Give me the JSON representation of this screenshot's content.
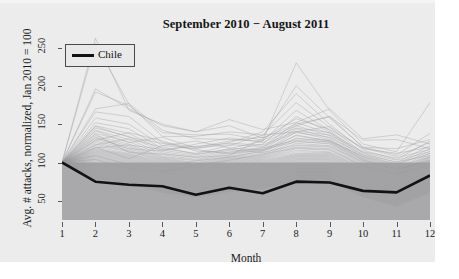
{
  "figure": {
    "title": "September 2010 − August 2011",
    "xlabel": "Month",
    "ylabel": "Avg. # attacks, normalized, Jan 2010 = 100",
    "background_color": "#ececed",
    "band_color": "#a9a9ab",
    "highlight_color": "#121212",
    "background_series_color": "#9b9b9d"
  },
  "legend": {
    "position": "top-left",
    "entries": [
      {
        "label": "Chile",
        "color": "#121212"
      }
    ]
  },
  "chart_data": {
    "type": "line",
    "title": "September 2010 − August 2011",
    "xlabel": "Month",
    "ylabel": "Avg. # attacks, normalized, Jan 2010 = 100",
    "x": [
      1,
      2,
      3,
      4,
      5,
      6,
      7,
      8,
      9,
      10,
      11,
      12
    ],
    "xtick_labels": [
      "1",
      "2",
      "3",
      "4",
      "5",
      "6",
      "7",
      "8",
      "9",
      "10",
      "11",
      "12"
    ],
    "ytick_labels": [
      "50",
      "100",
      "150",
      "200",
      "250"
    ],
    "yticks": [
      50,
      100,
      150,
      200,
      250
    ],
    "xlim": [
      1,
      12
    ],
    "ylim": [
      25,
      265
    ],
    "grid": false,
    "legend_position": "top-left",
    "shaded_band": {
      "from": 25,
      "to": 100,
      "color": "#a9a9ab"
    },
    "highlight_series": {
      "name": "Chile",
      "color": "#121212",
      "values": [
        100,
        75,
        71,
        69,
        58,
        67,
        60,
        75,
        74,
        63,
        61,
        83
      ]
    },
    "background_series": [
      {
        "name": "country-01",
        "values": [
          100,
          262,
          168,
          150,
          140,
          148,
          132,
          150,
          160,
          120,
          118,
          130
        ]
      },
      {
        "name": "country-02",
        "values": [
          100,
          255,
          176,
          134,
          134,
          140,
          136,
          140,
          147,
          118,
          112,
          120
        ]
      },
      {
        "name": "country-03",
        "values": [
          100,
          196,
          170,
          148,
          140,
          156,
          143,
          152,
          170,
          131,
          136,
          124
        ]
      },
      {
        "name": "country-04",
        "values": [
          100,
          192,
          174,
          139,
          136,
          137,
          129,
          148,
          160,
          129,
          130,
          118
        ]
      },
      {
        "name": "country-05",
        "values": [
          100,
          170,
          177,
          142,
          131,
          130,
          128,
          230,
          168,
          124,
          114,
          178
        ]
      },
      {
        "name": "country-06",
        "values": [
          100,
          166,
          160,
          126,
          120,
          128,
          133,
          200,
          158,
          120,
          110,
          138
        ]
      },
      {
        "name": "country-07",
        "values": [
          100,
          158,
          150,
          122,
          118,
          126,
          140,
          190,
          150,
          116,
          104,
          128
        ]
      },
      {
        "name": "country-08",
        "values": [
          100,
          152,
          144,
          118,
          112,
          122,
          136,
          178,
          146,
          112,
          100,
          122
        ]
      },
      {
        "name": "country-09",
        "values": [
          100,
          148,
          138,
          116,
          110,
          118,
          128,
          168,
          142,
          110,
          98,
          118
        ]
      },
      {
        "name": "country-10",
        "values": [
          100,
          145,
          134,
          114,
          108,
          116,
          124,
          160,
          140,
          108,
          96,
          115
        ]
      },
      {
        "name": "country-11",
        "values": [
          100,
          142,
          130,
          112,
          106,
          114,
          120,
          152,
          138,
          106,
          94,
          112
        ]
      },
      {
        "name": "country-12",
        "values": [
          100,
          138,
          127,
          110,
          104,
          112,
          118,
          148,
          135,
          104,
          92,
          110
        ]
      },
      {
        "name": "country-13",
        "values": [
          100,
          135,
          124,
          108,
          103,
          110,
          116,
          144,
          132,
          103,
          90,
          108
        ]
      },
      {
        "name": "country-14",
        "values": [
          100,
          132,
          122,
          107,
          102,
          108,
          114,
          140,
          130,
          102,
          89,
          107
        ]
      },
      {
        "name": "country-15",
        "values": [
          100,
          130,
          120,
          106,
          100,
          107,
          112,
          136,
          128,
          100,
          88,
          106
        ]
      },
      {
        "name": "country-16",
        "values": [
          100,
          128,
          118,
          105,
          99,
          106,
          110,
          132,
          126,
          99,
          87,
          105
        ]
      },
      {
        "name": "country-17",
        "values": [
          100,
          126,
          116,
          104,
          98,
          105,
          109,
          128,
          124,
          98,
          86,
          104
        ]
      },
      {
        "name": "country-18",
        "values": [
          100,
          124,
          115,
          103,
          97,
          104,
          108,
          125,
          122,
          97,
          85,
          103
        ]
      },
      {
        "name": "country-19",
        "values": [
          100,
          122,
          114,
          102,
          96,
          103,
          107,
          122,
          120,
          96,
          84,
          102
        ]
      },
      {
        "name": "country-20",
        "values": [
          100,
          120,
          112,
          101,
          95,
          102,
          106,
          120,
          118,
          95,
          83,
          101
        ]
      },
      {
        "name": "country-21",
        "values": [
          100,
          118,
          111,
          100,
          94,
          101,
          105,
          118,
          116,
          94,
          82,
          100
        ]
      },
      {
        "name": "country-22",
        "values": [
          100,
          117,
          110,
          99,
          93,
          100,
          104,
          116,
          114,
          93,
          81,
          99
        ]
      },
      {
        "name": "country-23",
        "values": [
          100,
          116,
          109,
          98,
          92,
          99,
          103,
          114,
          113,
          92,
          80,
          98
        ]
      },
      {
        "name": "country-24",
        "values": [
          100,
          115,
          108,
          97,
          91,
          98,
          102,
          112,
          112,
          91,
          79,
          97
        ]
      },
      {
        "name": "country-25",
        "values": [
          100,
          114,
          107,
          96,
          90,
          97,
          101,
          111,
          111,
          90,
          78,
          96
        ]
      },
      {
        "name": "country-26",
        "values": [
          100,
          113,
          106,
          95,
          89,
          96,
          100,
          110,
          110,
          89,
          77,
          95
        ]
      },
      {
        "name": "country-27",
        "values": [
          100,
          112,
          105,
          94,
          88,
          95,
          99,
          109,
          109,
          88,
          76,
          94
        ]
      },
      {
        "name": "country-28",
        "values": [
          100,
          111,
          104,
          93,
          87,
          94,
          98,
          108,
          108,
          87,
          75,
          93
        ]
      },
      {
        "name": "country-29",
        "values": [
          100,
          110,
          103,
          92,
          86,
          93,
          97,
          107,
          107,
          86,
          74,
          92
        ]
      },
      {
        "name": "country-30",
        "values": [
          100,
          109,
          102,
          91,
          85,
          92,
          96,
          106,
          106,
          85,
          73,
          91
        ]
      },
      {
        "name": "country-31",
        "values": [
          100,
          108,
          101,
          90,
          84,
          91,
          95,
          105,
          105,
          84,
          72,
          90
        ]
      },
      {
        "name": "country-32",
        "values": [
          100,
          107,
          100,
          89,
          83,
          90,
          94,
          104,
          104,
          83,
          71,
          89
        ]
      },
      {
        "name": "country-33",
        "values": [
          100,
          106,
          99,
          88,
          82,
          89,
          93,
          103,
          103,
          82,
          70,
          88
        ]
      },
      {
        "name": "country-34",
        "values": [
          100,
          105,
          98,
          87,
          81,
          88,
          92,
          102,
          102,
          81,
          69,
          87
        ]
      },
      {
        "name": "country-35",
        "values": [
          100,
          104,
          97,
          86,
          80,
          87,
          91,
          101,
          101,
          80,
          68,
          86
        ]
      },
      {
        "name": "country-36",
        "values": [
          100,
          103,
          96,
          85,
          79,
          86,
          90,
          100,
          100,
          79,
          67,
          85
        ]
      },
      {
        "name": "country-37",
        "values": [
          100,
          102,
          95,
          84,
          78,
          85,
          89,
          99,
          99,
          78,
          66,
          84
        ]
      },
      {
        "name": "country-38",
        "values": [
          100,
          101,
          94,
          83,
          77,
          84,
          88,
          98,
          98,
          77,
          65,
          83
        ]
      },
      {
        "name": "country-39",
        "values": [
          100,
          100,
          93,
          82,
          76,
          83,
          87,
          97,
          97,
          76,
          64,
          82
        ]
      },
      {
        "name": "country-40",
        "values": [
          100,
          99,
          92,
          81,
          75,
          82,
          86,
          96,
          96,
          75,
          63,
          81
        ]
      },
      {
        "name": "country-41",
        "values": [
          100,
          98,
          91,
          80,
          74,
          81,
          85,
          95,
          95,
          74,
          62,
          80
        ]
      },
      {
        "name": "country-42",
        "values": [
          100,
          97,
          90,
          79,
          73,
          80,
          84,
          94,
          94,
          73,
          61,
          79
        ]
      },
      {
        "name": "country-43",
        "values": [
          100,
          96,
          89,
          78,
          72,
          79,
          83,
          93,
          93,
          72,
          60,
          78
        ]
      },
      {
        "name": "country-44",
        "values": [
          100,
          95,
          88,
          77,
          71,
          78,
          82,
          92,
          92,
          71,
          59,
          77
        ]
      },
      {
        "name": "country-45",
        "values": [
          100,
          94,
          87,
          76,
          70,
          77,
          81,
          91,
          91,
          70,
          58,
          76
        ]
      },
      {
        "name": "country-46",
        "values": [
          100,
          93,
          86,
          75,
          69,
          76,
          80,
          90,
          90,
          69,
          57,
          75
        ]
      },
      {
        "name": "country-47",
        "values": [
          100,
          92,
          85,
          74,
          68,
          75,
          79,
          89,
          89,
          68,
          56,
          74
        ]
      },
      {
        "name": "country-48",
        "values": [
          100,
          91,
          84,
          73,
          67,
          74,
          78,
          88,
          88,
          67,
          55,
          73
        ]
      },
      {
        "name": "country-49",
        "values": [
          100,
          90,
          83,
          72,
          66,
          73,
          77,
          87,
          87,
          66,
          54,
          72
        ]
      },
      {
        "name": "country-50",
        "values": [
          100,
          89,
          82,
          71,
          65,
          72,
          76,
          86,
          86,
          65,
          53,
          71
        ]
      },
      {
        "name": "country-51",
        "values": [
          100,
          88,
          81,
          70,
          64,
          71,
          75,
          85,
          85,
          64,
          52,
          70
        ]
      },
      {
        "name": "country-52",
        "values": [
          100,
          87,
          80,
          69,
          63,
          70,
          74,
          84,
          84,
          63,
          51,
          69
        ]
      },
      {
        "name": "country-53",
        "values": [
          100,
          86,
          79,
          68,
          62,
          69,
          73,
          83,
          83,
          62,
          50,
          68
        ]
      },
      {
        "name": "country-54",
        "values": [
          100,
          85,
          78,
          67,
          61,
          68,
          72,
          82,
          82,
          61,
          49,
          67
        ]
      },
      {
        "name": "country-55",
        "values": [
          100,
          84,
          77,
          66,
          60,
          67,
          71,
          81,
          81,
          60,
          48,
          66
        ]
      },
      {
        "name": "country-56",
        "values": [
          100,
          83,
          76,
          65,
          59,
          66,
          70,
          80,
          80,
          59,
          47,
          65
        ]
      },
      {
        "name": "country-57",
        "values": [
          100,
          82,
          75,
          64,
          58,
          65,
          69,
          79,
          79,
          58,
          46,
          64
        ]
      },
      {
        "name": "country-58",
        "values": [
          100,
          81,
          74,
          63,
          57,
          64,
          68,
          78,
          78,
          57,
          45,
          63
        ]
      },
      {
        "name": "country-59",
        "values": [
          100,
          80,
          73,
          62,
          56,
          63,
          67,
          77,
          77,
          56,
          44,
          62
        ]
      },
      {
        "name": "country-60",
        "values": [
          100,
          79,
          72,
          61,
          55,
          62,
          66,
          76,
          76,
          55,
          43,
          61
        ]
      },
      {
        "name": "country-61",
        "values": [
          100,
          120,
          105,
          122,
          128,
          119,
          116,
          135,
          128,
          108,
          98,
          112
        ]
      },
      {
        "name": "country-62",
        "values": [
          100,
          133,
          118,
          115,
          124,
          132,
          126,
          145,
          139,
          114,
          106,
          117
        ]
      },
      {
        "name": "country-63",
        "values": [
          100,
          141,
          126,
          133,
          119,
          123,
          121,
          139,
          133,
          110,
          101,
          109
        ]
      },
      {
        "name": "country-64",
        "values": [
          100,
          129,
          139,
          128,
          115,
          113,
          119,
          129,
          127,
          105,
          93,
          103
        ]
      },
      {
        "name": "country-65",
        "values": [
          100,
          123,
          131,
          120,
          111,
          117,
          113,
          123,
          121,
          101,
          91,
          100
        ]
      },
      {
        "name": "country-66",
        "values": [
          100,
          137,
          113,
          111,
          107,
          109,
          131,
          157,
          143,
          119,
          108,
          126
        ]
      },
      {
        "name": "country-67",
        "values": [
          100,
          119,
          123,
          117,
          121,
          125,
          123,
          141,
          136,
          113,
          103,
          114
        ]
      },
      {
        "name": "country-68",
        "values": [
          100,
          147,
          133,
          125,
          117,
          111,
          117,
          127,
          125,
          103,
          92,
          101
        ]
      },
      {
        "name": "country-69",
        "values": [
          100,
          109,
          97,
          94,
          102,
          107,
          115,
          131,
          129,
          107,
          95,
          107
        ]
      },
      {
        "name": "country-70",
        "values": [
          100,
          104,
          92,
          88,
          96,
          103,
          111,
          119,
          117,
          95,
          85,
          96
        ]
      }
    ]
  }
}
